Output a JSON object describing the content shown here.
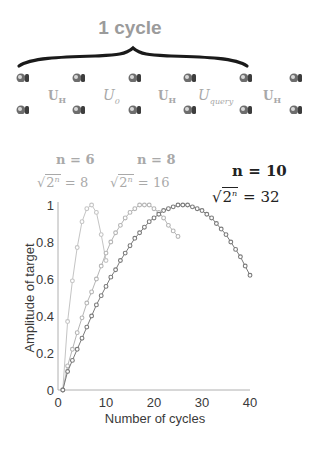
{
  "header": {
    "cycle_label": "1 cycle"
  },
  "circuit": {
    "ion_columns_x": [
      23,
      79,
      135,
      190,
      246,
      296
    ],
    "ion_rows_y": [
      78,
      110
    ],
    "gates": [
      {
        "label": "U",
        "sub": "H",
        "style": "bold",
        "x": 48
      },
      {
        "label": "U",
        "sub": "0",
        "style": "ital",
        "x": 103
      },
      {
        "label": "U",
        "sub": "H",
        "style": "bold",
        "x": 158
      },
      {
        "label": "U",
        "sub": "query",
        "style": "ital",
        "x": 198
      },
      {
        "label": "U",
        "sub": "H",
        "style": "bold",
        "x": 263
      }
    ]
  },
  "labels": [
    {
      "n": "n = 6",
      "root": "8",
      "color": "#a9a9a9"
    },
    {
      "n": "n = 8",
      "root": "16",
      "color": "#a9a9a9"
    },
    {
      "n": "n = 10",
      "root": "32",
      "color": "#222222"
    }
  ],
  "chart_data": {
    "type": "line",
    "title": "",
    "xlabel": "Number of cycles",
    "ylabel": "Amplitude of target",
    "xlim": [
      0,
      40
    ],
    "ylim": [
      0,
      1
    ],
    "xticks": [
      0,
      10,
      20,
      30,
      40
    ],
    "yticks": [
      0,
      0.2,
      0.4,
      0.6,
      0.8,
      1
    ],
    "ytick_labels": [
      "0",
      "0.2",
      "0.4",
      "0.6",
      "0.8",
      "1"
    ],
    "grid": false,
    "legend": "annotations above curves",
    "series": [
      {
        "name": "n = 6, sqrt(2^n) = 8",
        "color": "#c4c4c4",
        "x": [
          1,
          2,
          3,
          4,
          5,
          6,
          7,
          8,
          9,
          10
        ],
        "values": [
          0,
          0.37,
          0.59,
          0.77,
          0.91,
          0.98,
          1.0,
          0.96,
          0.84,
          0.7
        ]
      },
      {
        "name": "n = 8, sqrt(2^n) = 16",
        "color": "#b5b5b5",
        "x": [
          1,
          2,
          3,
          4,
          5,
          6,
          7,
          8,
          9,
          10,
          11,
          12,
          13,
          14,
          15,
          16,
          17,
          18,
          19,
          20,
          21,
          22,
          23,
          24,
          25
        ],
        "values": [
          0,
          0.13,
          0.22,
          0.31,
          0.39,
          0.47,
          0.53,
          0.6,
          0.67,
          0.74,
          0.8,
          0.85,
          0.89,
          0.93,
          0.96,
          0.98,
          1.0,
          1.0,
          1.0,
          0.98,
          0.96,
          0.93,
          0.89,
          0.86,
          0.83
        ]
      },
      {
        "name": "n = 10, sqrt(2^n) = 32",
        "color": "#7a7a7a",
        "x": [
          1,
          2,
          3,
          4,
          5,
          6,
          7,
          8,
          9,
          10,
          11,
          12,
          13,
          14,
          15,
          16,
          17,
          18,
          19,
          20,
          21,
          22,
          23,
          24,
          25,
          26,
          27,
          28,
          29,
          30,
          31,
          32,
          33,
          34,
          35,
          36,
          37,
          38,
          39,
          40
        ],
        "values": [
          0,
          0.1,
          0.16,
          0.22,
          0.28,
          0.34,
          0.4,
          0.46,
          0.51,
          0.56,
          0.61,
          0.65,
          0.7,
          0.74,
          0.78,
          0.82,
          0.85,
          0.88,
          0.91,
          0.93,
          0.95,
          0.97,
          0.98,
          0.99,
          1.0,
          1.0,
          1.0,
          0.99,
          0.98,
          0.97,
          0.95,
          0.93,
          0.9,
          0.87,
          0.84,
          0.8,
          0.76,
          0.72,
          0.67,
          0.62
        ]
      }
    ]
  }
}
